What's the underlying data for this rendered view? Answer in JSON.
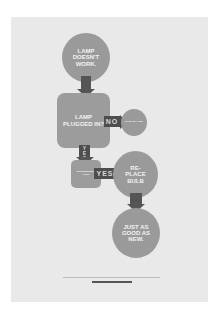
{
  "poster": {
    "background": "#e9e9e9",
    "shape_color": "#9a9a9a",
    "arrow_color": "#555555",
    "nodes": {
      "start": "LAMP DOESN'T WORK.",
      "question1": "LAMP PLUGGED IN?",
      "action_plug": "PLUG IN LAMP",
      "question2": "BULB BURNED OUT?",
      "action_replace": "RE-PLACE BULB",
      "end": "JUST AS GOOD AS NEW."
    },
    "labels": {
      "no": "NO",
      "yes_vertical": "YES",
      "yes_horizontal": "YES"
    },
    "footer_text": "www.example.com"
  }
}
